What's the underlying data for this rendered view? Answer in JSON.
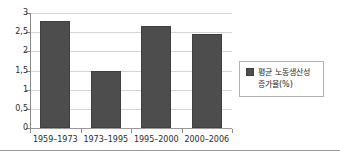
{
  "chart_data": {
    "type": "bar",
    "title": "",
    "xlabel": "",
    "ylabel": "",
    "categories": [
      "1959–1973",
      "1973–1995",
      "1995–2000",
      "2000–2006"
    ],
    "values": [
      2.8,
      1.48,
      2.65,
      2.45
    ],
    "series": [
      {
        "name": "평균 노동생산성 증가율(%)",
        "values": [
          2.8,
          1.48,
          2.65,
          2.45
        ]
      }
    ],
    "ylim": [
      0,
      3
    ],
    "ytick_labels": [
      "3",
      "2,5",
      "2",
      "1,5",
      "1",
      "0,5",
      "0"
    ],
    "ytick_values": [
      3,
      2.5,
      2,
      1.5,
      1,
      0.5,
      0
    ],
    "grid": true,
    "legend_position": "right",
    "bar_color": "#4d4d4d",
    "grid_color": "#d4d4d4",
    "axis_color": "#8a8a8a"
  },
  "legend": {
    "entries": [
      {
        "label": "평균 노동생산성\n증가율(%)",
        "color": "#4d4d4d"
      }
    ]
  }
}
